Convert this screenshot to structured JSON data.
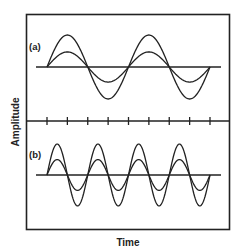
{
  "figure": {
    "ylabel": "Amplitude",
    "xlabel": "Time",
    "panels": [
      {
        "label": "(a)",
        "description": "Two sine waves, 2 cycles, larger and smaller amplitude, in phase"
      },
      {
        "label": "(b)",
        "description": "Two sine waves, 4 cycles, larger and smaller amplitude, in phase"
      }
    ],
    "tick_count": 9
  },
  "chart_data": {
    "type": "line",
    "title": "",
    "xlabel": "Time",
    "ylabel": "Amplitude",
    "grid": false,
    "panels": [
      {
        "label": "(a)",
        "cycles": 2,
        "series": [
          {
            "name": "large amplitude",
            "amplitude": 1.0
          },
          {
            "name": "small amplitude",
            "amplitude": 0.47
          }
        ]
      },
      {
        "label": "(b)",
        "cycles": 4,
        "series": [
          {
            "name": "large amplitude",
            "amplitude": 1.0
          },
          {
            "name": "small amplitude",
            "amplitude": 0.5
          }
        ]
      }
    ]
  },
  "colors": {
    "line": "#222222",
    "background": "#ffffff"
  }
}
